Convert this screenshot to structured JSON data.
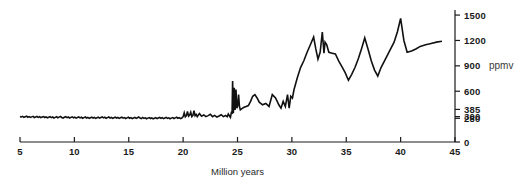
{
  "chart_data": {
    "type": "line",
    "title": "",
    "xlabel": "Million years",
    "ylabel": "ppmv",
    "unit_label": "ppmv",
    "xlim": [
      5,
      45
    ],
    "ylim": [
      0,
      1560
    ],
    "grid": false,
    "legend": null,
    "x_ticks": [
      5,
      10,
      15,
      20,
      25,
      30,
      35,
      40,
      45
    ],
    "x_tick_labels": [
      "5",
      "10",
      "15",
      "20",
      "25",
      "30",
      "35",
      "40",
      "45"
    ],
    "y_ticks": [
      0,
      280,
      300,
      385,
      600,
      900,
      1200,
      1500
    ],
    "y_tick_labels": [
      "0",
      "280",
      "300",
      "385",
      "600",
      "900",
      "1200",
      "1500"
    ],
    "series_name": "atmospheric CO2",
    "line_color": "#111111",
    "line_width": 1.6,
    "x": [
      5.0,
      5.12,
      5.24,
      5.36,
      5.48,
      5.6,
      5.72,
      5.84,
      5.96,
      6.08,
      6.2,
      6.32,
      6.44,
      6.56,
      6.68,
      6.8,
      6.92,
      7.04,
      7.16,
      7.28,
      7.4,
      7.52,
      7.64,
      7.76,
      7.88,
      8.0,
      8.12,
      8.24,
      8.36,
      8.48,
      8.6,
      8.72,
      8.84,
      8.96,
      9.08,
      9.2,
      9.32,
      9.44,
      9.56,
      9.68,
      9.8,
      9.92,
      10.04,
      10.16,
      10.28,
      10.4,
      10.52,
      10.64,
      10.76,
      10.88,
      11.0,
      11.12,
      11.24,
      11.36,
      11.48,
      11.6,
      11.72,
      11.84,
      11.96,
      12.08,
      12.2,
      12.32,
      12.44,
      12.56,
      12.68,
      12.8,
      12.92,
      13.04,
      13.16,
      13.28,
      13.4,
      13.52,
      13.64,
      13.76,
      13.88,
      14.0,
      14.12,
      14.24,
      14.36,
      14.48,
      14.6,
      14.72,
      14.84,
      14.96,
      15.08,
      15.2,
      15.32,
      15.44,
      15.56,
      15.68,
      15.8,
      15.92,
      16.04,
      16.16,
      16.28,
      16.4,
      16.52,
      16.64,
      16.76,
      16.88,
      17.0,
      17.12,
      17.24,
      17.36,
      17.48,
      17.6,
      17.72,
      17.84,
      17.96,
      18.08,
      18.2,
      18.32,
      18.44,
      18.56,
      18.68,
      18.8,
      18.92,
      19.04,
      19.16,
      19.28,
      19.4,
      19.52,
      19.64,
      19.76,
      19.88,
      20.0,
      20.1,
      20.2,
      20.3,
      20.4,
      20.5,
      20.6,
      20.7,
      20.8,
      20.9,
      21.0,
      21.1,
      21.2,
      21.3,
      21.4,
      21.5,
      21.7,
      21.9,
      22.1,
      22.3,
      22.5,
      22.7,
      22.9,
      23.1,
      23.3,
      23.5,
      23.7,
      23.9,
      24.05,
      24.15,
      24.25,
      24.35,
      24.45,
      24.5,
      24.55,
      24.62,
      24.7,
      24.78,
      24.86,
      24.94,
      25.02,
      25.1,
      25.18,
      25.26,
      25.4,
      25.6,
      25.8,
      26.0,
      26.2,
      26.4,
      26.6,
      26.8,
      27.0,
      27.3,
      27.6,
      27.9,
      28.2,
      28.5,
      28.8,
      29.0,
      29.2,
      29.4,
      29.6,
      29.75,
      29.9,
      30.05,
      30.2,
      30.5,
      30.8,
      31.1,
      31.4,
      31.7,
      32.0,
      32.2,
      32.4,
      32.6,
      32.8,
      32.95,
      33.05,
      33.2,
      33.4,
      33.7,
      34.0,
      34.3,
      34.6,
      34.9,
      35.2,
      35.5,
      35.8,
      36.1,
      36.4,
      36.7,
      37.0,
      37.3,
      37.6,
      37.9,
      38.2,
      38.6,
      39.0,
      39.4,
      39.7,
      40.0,
      40.3,
      40.6,
      41.0,
      41.4,
      41.8,
      42.3,
      42.8,
      43.3,
      43.8,
      44.0
    ],
    "y": [
      300,
      296,
      303,
      292,
      299,
      305,
      293,
      300,
      290,
      297,
      303,
      289,
      296,
      302,
      291,
      298,
      288,
      295,
      301,
      290,
      297,
      286,
      293,
      299,
      288,
      295,
      284,
      291,
      298,
      287,
      294,
      301,
      290,
      283,
      292,
      299,
      288,
      295,
      284,
      291,
      297,
      286,
      293,
      282,
      289,
      296,
      285,
      292,
      281,
      288,
      295,
      284,
      291,
      280,
      287,
      294,
      283,
      290,
      279,
      286,
      293,
      282,
      289,
      296,
      285,
      292,
      281,
      288,
      295,
      284,
      291,
      280,
      287,
      294,
      283,
      290,
      279,
      286,
      293,
      282,
      289,
      278,
      285,
      292,
      281,
      288,
      277,
      284,
      291,
      280,
      287,
      296,
      283,
      276,
      290,
      279,
      286,
      275,
      282,
      289,
      278,
      285,
      274,
      281,
      288,
      277,
      284,
      291,
      280,
      287,
      276,
      283,
      290,
      279,
      286,
      275,
      282,
      289,
      278,
      285,
      292,
      281,
      288,
      277,
      284,
      300,
      345,
      298,
      312,
      360,
      305,
      318,
      352,
      300,
      315,
      370,
      310,
      325,
      300,
      318,
      335,
      305,
      320,
      300,
      312,
      328,
      300,
      315,
      295,
      308,
      322,
      300,
      314,
      298,
      330,
      310,
      290,
      360,
      330,
      720,
      340,
      640,
      380,
      620,
      400,
      430,
      560,
      420,
      380,
      395,
      410,
      420,
      430,
      480,
      540,
      560,
      520,
      470,
      440,
      455,
      420,
      560,
      520,
      440,
      400,
      480,
      420,
      560,
      400,
      540,
      520,
      620,
      760,
      880,
      960,
      1060,
      1150,
      1240,
      1100,
      980,
      1060,
      1300,
      1050,
      1180,
      1150,
      1060,
      1050,
      1040,
      960,
      890,
      820,
      730,
      800,
      880,
      980,
      1100,
      1230,
      1100,
      960,
      850,
      780,
      880,
      980,
      1080,
      1180,
      1300,
      1460,
      1200,
      1060,
      1075,
      1100,
      1130,
      1150,
      1165,
      1180,
      1190
    ]
  },
  "axis": {
    "x_start_px": 20,
    "x_end_px": 455,
    "y_zero_px": 142,
    "y_top_px": 10
  }
}
